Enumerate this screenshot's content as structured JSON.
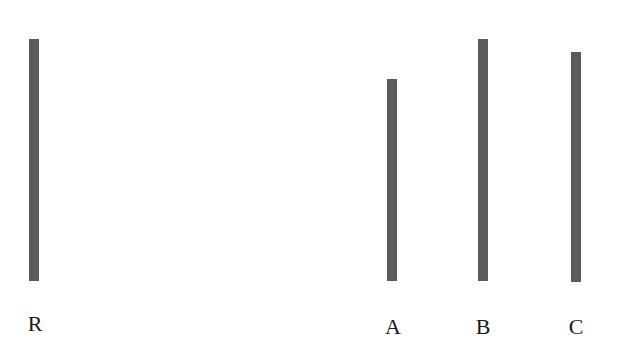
{
  "diagram": {
    "type": "line-length-comparison",
    "line_color": "#5b5b5b",
    "reference": {
      "label": "R",
      "x": 34,
      "top": 39,
      "bottom": 281,
      "length_px": 242
    },
    "options": [
      {
        "label": "A",
        "x": 392,
        "top": 79,
        "bottom": 281,
        "length_px": 202
      },
      {
        "label": "B",
        "x": 483,
        "top": 39,
        "bottom": 281,
        "length_px": 242
      },
      {
        "label": "C",
        "x": 576,
        "top": 52,
        "bottom": 282,
        "length_px": 230
      }
    ]
  }
}
